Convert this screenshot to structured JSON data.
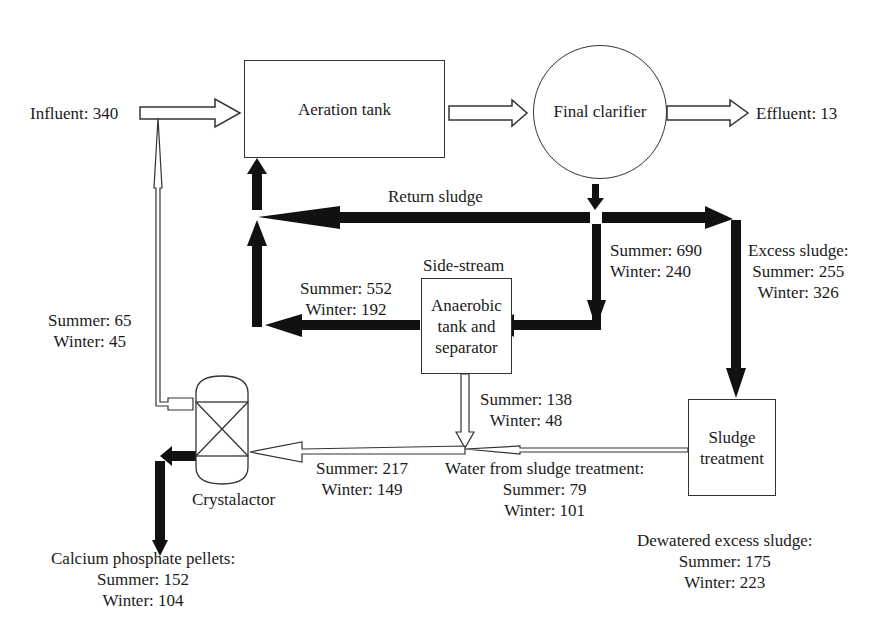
{
  "units": {
    "aeration_tank": "Aeration tank",
    "final_clarifier": "Final clarifier",
    "side_stream_label": "Side-stream",
    "anaerobic_tank": [
      "Anaerobic",
      "tank and",
      "separator"
    ],
    "sludge_treatment": [
      "Sludge",
      "treatment"
    ],
    "crystalactor": "Crystalactor"
  },
  "flows": {
    "influent": "Influent: 340",
    "effluent": "Effluent: 13",
    "return_sludge": "Return sludge",
    "clarifier_to_sidestream": {
      "summer": "Summer: 690",
      "winter": "Winter: 240"
    },
    "excess_sludge": {
      "title": "Excess sludge:",
      "summer": "Summer: 255",
      "winter": "Winter: 326"
    },
    "sidestream_return": {
      "summer": "Summer: 552",
      "winter": "Winter: 192"
    },
    "crystalactor_return": {
      "summer": "Summer: 65",
      "winter": "Winter: 45"
    },
    "sidestream_supernatant": {
      "summer": "Summer: 138",
      "winter": "Winter: 48"
    },
    "to_crystalactor": {
      "summer": "Summer: 217",
      "winter": "Winter: 149"
    },
    "water_from_sludge_treatment": {
      "title": "Water from sludge treatment:",
      "summer": "Summer: 79",
      "winter": "Winter: 101"
    },
    "dewatered_excess_sludge": {
      "title": "Dewatered excess sludge:",
      "summer": "Summer: 175",
      "winter": "Winter: 223"
    },
    "calcium_phosphate_pellets": {
      "title": "Calcium phosphate pellets:",
      "summer": "Summer: 152",
      "winter": "Winter: 104"
    }
  },
  "colors": {
    "line": "#333333",
    "sludge_arrow": "#111111",
    "background": "#ffffff"
  }
}
